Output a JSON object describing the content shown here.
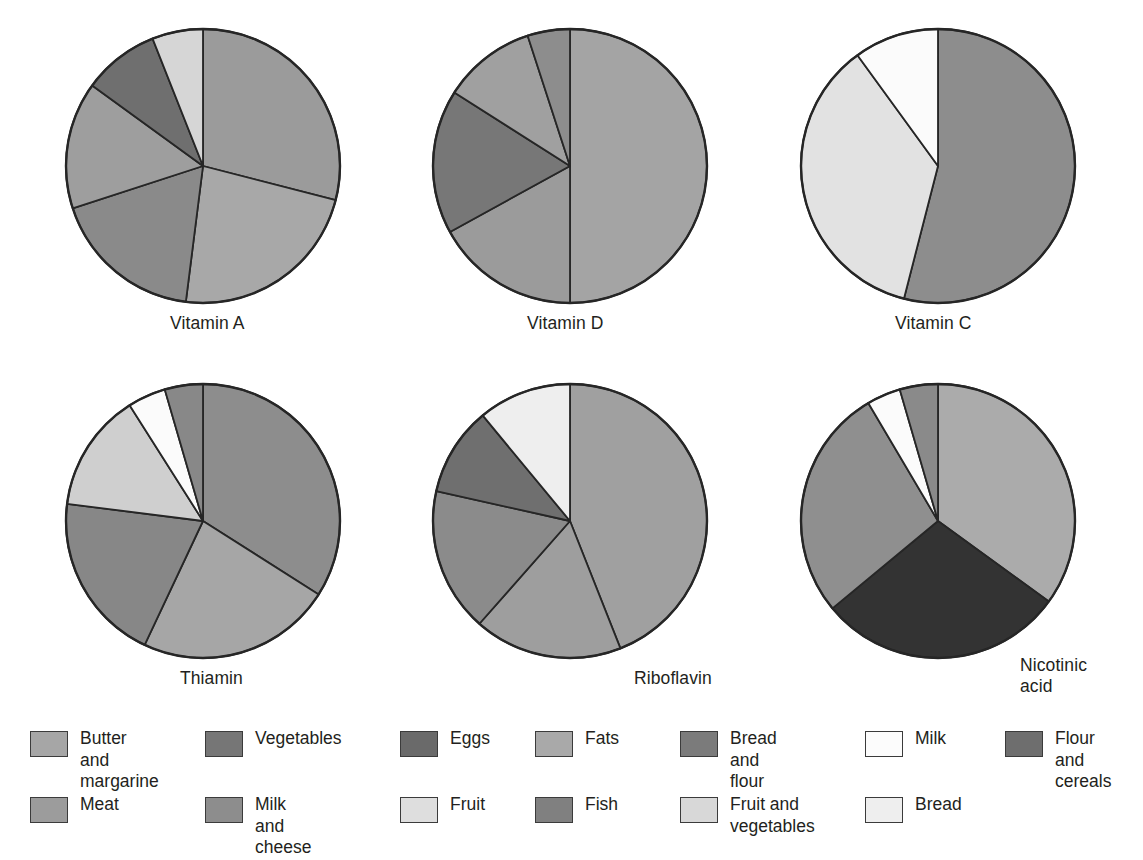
{
  "figure": {
    "title": ""
  },
  "colors": {
    "butter_and_margarine": "#a3a3a3",
    "vegetables": "#757575",
    "eggs": "#6d6d6d",
    "fats": "#a8a8a8",
    "bread_and_flour": "#7a7a7a",
    "milk": "#fbfbfb",
    "flour_and_cereals": "#6f6f6f",
    "meat": "#9a9a9a",
    "milk_and_cheese": "#8d8d8d",
    "fruit": "#dcdcdc",
    "fish": "#828282",
    "fruit_and_vegetables": "#d9d9d9",
    "bread": "#ededed",
    "very_dark": "#303030",
    "outline": "#262626",
    "text": "#231f20"
  },
  "charts": [
    {
      "id": "vitamin-a",
      "label": "Vitamin A",
      "label_x": 170,
      "label_y": 313,
      "cx": 203,
      "cy": 166,
      "r": 137,
      "slices": [
        {
          "name": "Milk and cheese",
          "value": 29.0,
          "color": "#9b9b9b"
        },
        {
          "name": "Butter and margarine",
          "value": 23.0,
          "color": "#a8a8a8"
        },
        {
          "name": "Vegetables",
          "value": 18.0,
          "color": "#8a8a8a"
        },
        {
          "name": "Meat",
          "value": 15.0,
          "color": "#9e9e9e"
        },
        {
          "name": "Eggs",
          "value": 9.0,
          "color": "#6f6f6f"
        },
        {
          "name": "Fruit",
          "value": 6.0,
          "color": "#d6d6d6"
        }
      ]
    },
    {
      "id": "vitamin-d",
      "label": "Vitamin D",
      "label_x": 527,
      "label_y": 313,
      "cx": 570,
      "cy": 166,
      "r": 137,
      "slices": [
        {
          "name": "Butter and margarine",
          "value": 50.0,
          "color": "#a4a4a4"
        },
        {
          "name": "Milk and cheese",
          "value": 17.0,
          "color": "#9b9b9b"
        },
        {
          "name": "Eggs",
          "value": 17.0,
          "color": "#777777"
        },
        {
          "name": "Fish",
          "value": 11.0,
          "color": "#a0a0a0"
        },
        {
          "name": "Meat",
          "value": 5.0,
          "color": "#8d8d8d"
        }
      ]
    },
    {
      "id": "vitamin-c",
      "label": "Vitamin C",
      "label_x": 895,
      "label_y": 313,
      "cx": 938,
      "cy": 166,
      "r": 137,
      "slices": [
        {
          "name": "Vegetables",
          "value": 54.0,
          "color": "#8d8d8d"
        },
        {
          "name": "Fruit",
          "value": 36.0,
          "color": "#e2e2e2"
        },
        {
          "name": "Milk",
          "value": 10.0,
          "color": "#fbfbfb"
        }
      ]
    },
    {
      "id": "thiamin",
      "label": "Thiamin",
      "label_x": 180,
      "label_y": 668,
      "cx": 203,
      "cy": 521,
      "r": 137,
      "slices": [
        {
          "name": "Bread and flour",
          "value": 34.0,
          "color": "#8d8d8d"
        },
        {
          "name": "Meat",
          "value": 23.0,
          "color": "#a6a6a6"
        },
        {
          "name": "Vegetables",
          "value": 20.0,
          "color": "#878787"
        },
        {
          "name": "Fruit and vegetables",
          "value": 14.0,
          "color": "#cfcfcf"
        },
        {
          "name": "Milk",
          "value": 4.5,
          "color": "#fbfbfb"
        },
        {
          "name": "Fish",
          "value": 4.5,
          "color": "#888888"
        }
      ]
    },
    {
      "id": "riboflavin",
      "label": "Riboflavin",
      "label_x": 634,
      "label_y": 668,
      "cx": 570,
      "cy": 521,
      "r": 137,
      "slices": [
        {
          "name": "Milk and cheese",
          "value": 44.0,
          "color": "#a0a0a0"
        },
        {
          "name": "Meat",
          "value": 17.5,
          "color": "#9e9e9e"
        },
        {
          "name": "Bread and flour",
          "value": 17.0,
          "color": "#8b8b8b"
        },
        {
          "name": "Eggs",
          "value": 10.5,
          "color": "#6f6f6f"
        },
        {
          "name": "Bread",
          "value": 11.0,
          "color": "#eeeeee"
        }
      ]
    },
    {
      "id": "nicotinic-acid",
      "label": "Nicotinic\nacid",
      "label_x": 1020,
      "label_y": 655,
      "cx": 938,
      "cy": 521,
      "r": 137,
      "slices": [
        {
          "name": "Fats",
          "value": 35.0,
          "color": "#ababab"
        },
        {
          "name": "Flour and cereals",
          "value": 29.0,
          "color": "#333333"
        },
        {
          "name": "Meat",
          "value": 27.5,
          "color": "#8f8f8f"
        },
        {
          "name": "Milk",
          "value": 4.0,
          "color": "#fbfbfb"
        },
        {
          "name": "Fish",
          "value": 4.5,
          "color": "#8a8a8a"
        }
      ]
    }
  ],
  "legend": {
    "columns": [
      {
        "x": 30,
        "items": [
          {
            "label": "Butter and\nmargarine",
            "color": "#a6a6a6",
            "y": 12
          },
          {
            "label": "Meat",
            "color": "#9c9c9c",
            "y": 78
          }
        ]
      },
      {
        "x": 205,
        "items": [
          {
            "label": "Vegetables",
            "color": "#767676",
            "y": 12
          },
          {
            "label": "Milk and\ncheese",
            "color": "#8d8d8d",
            "y": 78
          }
        ]
      },
      {
        "x": 400,
        "items": [
          {
            "label": "Eggs",
            "color": "#6a6a6a",
            "y": 12
          },
          {
            "label": "Fruit",
            "color": "#dedede",
            "y": 78
          }
        ]
      },
      {
        "x": 535,
        "items": [
          {
            "label": "Fats",
            "color": "#a9a9a9",
            "y": 12
          },
          {
            "label": "Fish",
            "color": "#808080",
            "y": 78
          }
        ]
      },
      {
        "x": 680,
        "items": [
          {
            "label": "Bread and\nflour",
            "color": "#7b7b7b",
            "y": 12
          },
          {
            "label": "Fruit and\nvegetables",
            "color": "#d8d8d8",
            "y": 78
          }
        ]
      },
      {
        "x": 865,
        "items": [
          {
            "label": "Milk",
            "color": "#fcfcfc",
            "y": 12
          },
          {
            "label": "Bread",
            "color": "#eeeeee",
            "y": 78
          }
        ]
      },
      {
        "x": 1005,
        "items": [
          {
            "label": "Flour and\ncereals",
            "color": "#6e6e6e",
            "y": 12
          }
        ]
      }
    ]
  },
  "chart_data": {
    "type": "pie",
    "note": "Six separate pie charts; values are percentage shares estimated from slice angles.",
    "legend_position": "bottom",
    "panels": [
      {
        "title": "Vitamin A",
        "labels": [
          "Milk and cheese",
          "Butter and margarine",
          "Vegetables",
          "Meat",
          "Eggs",
          "Fruit"
        ],
        "values": [
          29,
          23,
          18,
          15,
          9,
          6
        ]
      },
      {
        "title": "Vitamin D",
        "labels": [
          "Butter and margarine",
          "Milk and cheese",
          "Eggs",
          "Fish",
          "Meat"
        ],
        "values": [
          50,
          17,
          17,
          11,
          5
        ]
      },
      {
        "title": "Vitamin C",
        "labels": [
          "Vegetables",
          "Fruit",
          "Milk"
        ],
        "values": [
          54,
          36,
          10
        ]
      },
      {
        "title": "Thiamin",
        "labels": [
          "Bread and flour",
          "Meat",
          "Vegetables",
          "Fruit and vegetables",
          "Milk",
          "Fish"
        ],
        "values": [
          34,
          23,
          20,
          14,
          4.5,
          4.5
        ]
      },
      {
        "title": "Riboflavin",
        "labels": [
          "Milk and cheese",
          "Meat",
          "Bread and flour",
          "Eggs",
          "Bread"
        ],
        "values": [
          44,
          17.5,
          17,
          10.5,
          11
        ]
      },
      {
        "title": "Nicotinic acid",
        "labels": [
          "Fats",
          "Flour and cereals",
          "Meat",
          "Milk",
          "Fish"
        ],
        "values": [
          35,
          29,
          27.5,
          4,
          4.5
        ]
      }
    ]
  }
}
